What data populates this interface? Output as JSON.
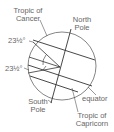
{
  "diagram": {
    "type": "earth-tilt-tropics",
    "labels": {
      "tropic_cancer_1": "Tropic of",
      "tropic_cancer_2": "Cancer",
      "north_pole_1": "North",
      "north_pole_2": "Pole",
      "angle_top": "23½°",
      "angle_bottom": "23½°",
      "south_pole_1": "South",
      "south_pole_2": "Pole",
      "equator": "equator",
      "tropic_capricorn_1": "Tropic of",
      "tropic_capricorn_2": "Capricorn"
    },
    "colors": {
      "stroke": "#333333",
      "circle": "#555555",
      "text": "#666666"
    }
  }
}
